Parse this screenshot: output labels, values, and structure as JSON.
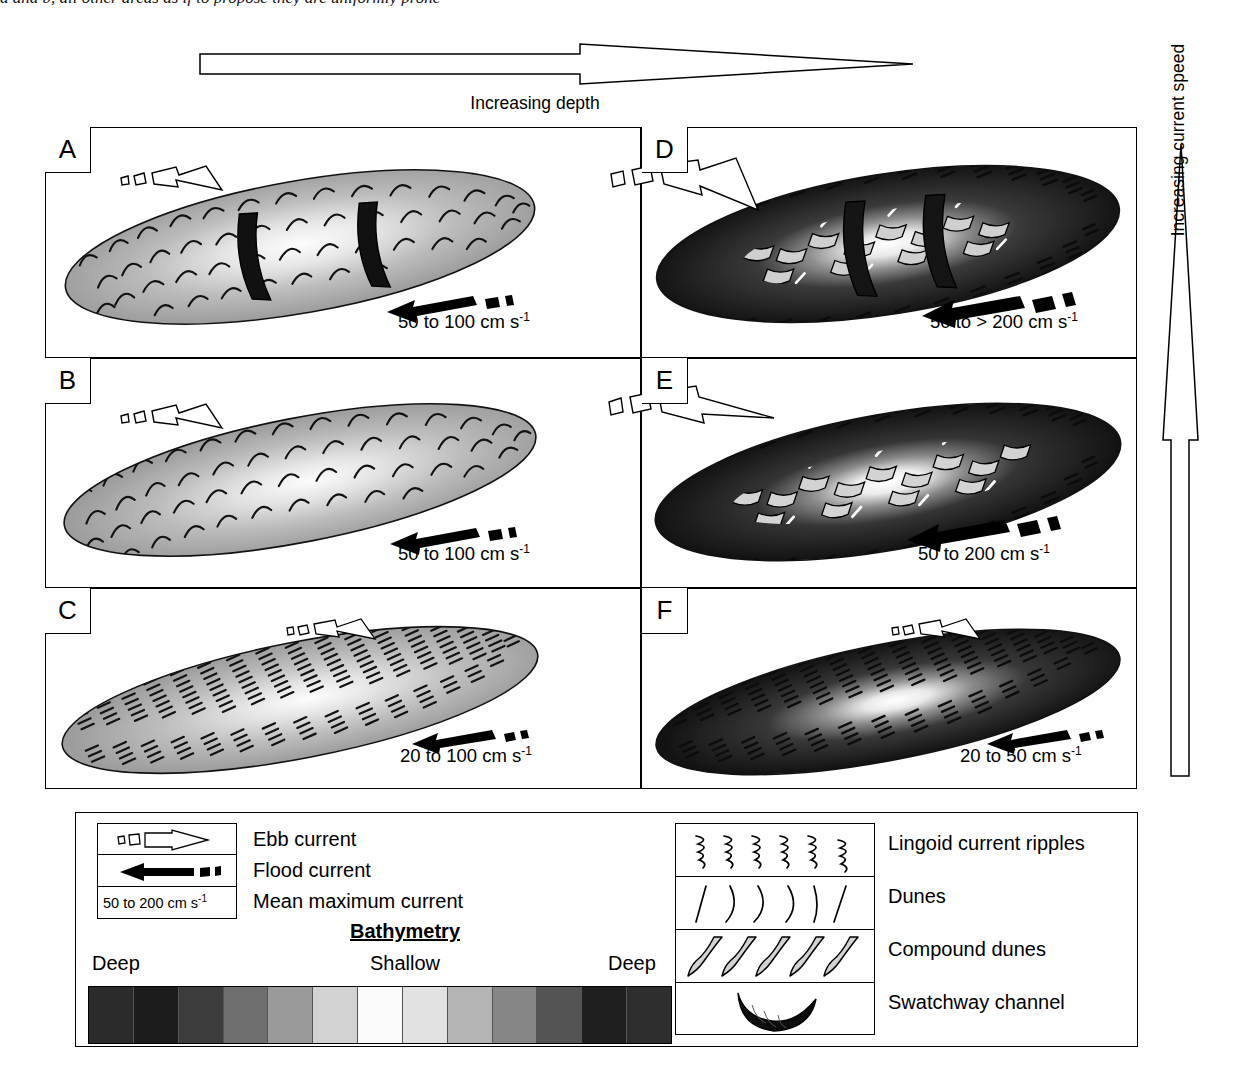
{
  "caption_sliver": "a and b, all other areas as if to propose they are uniformly prone",
  "axes": {
    "depth_arrow_label": "Increasing depth",
    "speed_arrow_label": "Increasing current speed"
  },
  "panels": [
    {
      "id": "A",
      "label": "A",
      "speed": "50 to 100 cm s",
      "exp": "-1",
      "tone": "light",
      "bedform": "dunes",
      "swatchways": 2,
      "ebb_arrow": "ebb-current-arrow",
      "flood_arrow": "flood-current-arrow"
    },
    {
      "id": "D",
      "label": "D",
      "speed": "50 to > 200 cm s",
      "exp": "-1",
      "tone": "dark",
      "bedform": "compound-dunes",
      "swatchways": 2,
      "ebb_arrow": "ebb-current-arrow",
      "flood_arrow": "flood-current-arrow"
    },
    {
      "id": "B",
      "label": "B",
      "speed": "50 to 100 cm s",
      "exp": "-1",
      "tone": "light",
      "bedform": "dunes",
      "swatchways": 0,
      "ebb_arrow": "ebb-current-arrow",
      "flood_arrow": "flood-current-arrow"
    },
    {
      "id": "E",
      "label": "E",
      "speed": "50 to 200 cm s",
      "exp": "-1",
      "tone": "dark",
      "bedform": "compound-dunes",
      "swatchways": 0,
      "ebb_arrow": "ebb-current-arrow",
      "flood_arrow": "flood-current-arrow"
    },
    {
      "id": "C",
      "label": "C",
      "speed": "20 to 100 cm s",
      "exp": "-1",
      "tone": "light",
      "bedform": "ripples",
      "swatchways": 0,
      "ebb_arrow": "ebb-current-arrow",
      "flood_arrow": "flood-current-arrow"
    },
    {
      "id": "F",
      "label": "F",
      "speed": "20 to 50 cm s",
      "exp": "-1",
      "tone": "dark",
      "bedform": "ripples",
      "swatchways": 0,
      "ebb_arrow": "ebb-current-arrow",
      "flood_arrow": "flood-current-arrow"
    }
  ],
  "legend": {
    "current_keys": [
      {
        "symbol": "ebb-current-arrow",
        "label": "Ebb current"
      },
      {
        "symbol": "flood-current-arrow",
        "label": "Flood current"
      },
      {
        "symbol": "speed-scale-box",
        "label": "Mean maximum current",
        "box_text": "50 to 200 cm s",
        "box_exp": "-1"
      }
    ],
    "bathymetry": {
      "title": "Bathymetry",
      "left_label": "Deep",
      "center_label": "Shallow",
      "right_label": "Deep",
      "swatches": [
        "#2b2b2b",
        "#1c1c1c",
        "#3c3c3c",
        "#6e6e6e",
        "#9a9a9a",
        "#d2d2d2",
        "#fafafa",
        "#e2e2e2",
        "#b4b4b4",
        "#868686",
        "#545454",
        "#1f1f1f",
        "#2e2e2e"
      ]
    },
    "bedforms": [
      {
        "symbol": "lingoid-ripples-icon",
        "label": "Lingoid current ripples"
      },
      {
        "symbol": "dunes-icon",
        "label": "Dunes"
      },
      {
        "symbol": "compound-dunes-icon",
        "label": "Compound dunes"
      },
      {
        "symbol": "swatchway-channel-icon",
        "label": "Swatchway channel"
      }
    ]
  },
  "chart_data": {
    "type": "diagram",
    "x_axis": {
      "label": "Increasing depth",
      "direction": "left-to-right",
      "categories": [
        "shallow (left column)",
        "deep (right column)"
      ]
    },
    "y_axis": {
      "label": "Increasing current speed",
      "direction": "bottom-to-top",
      "categories": [
        "low (row C/F)",
        "medium (row B/E)",
        "high (row A/D)"
      ]
    },
    "cells": [
      {
        "panel": "A",
        "depth": "shallow",
        "current_speed_rank": 3,
        "speed_range_cm_s": [
          50,
          100
        ],
        "bedforms": [
          "dunes"
        ],
        "swatchway_channels": 2
      },
      {
        "panel": "D",
        "depth": "deep",
        "current_speed_rank": 3,
        "speed_range_cm_s": [
          50,
          200
        ],
        "speed_open_ended": true,
        "bedforms": [
          "compound dunes",
          "dunes"
        ],
        "swatchway_channels": 2
      },
      {
        "panel": "B",
        "depth": "shallow",
        "current_speed_rank": 2,
        "speed_range_cm_s": [
          50,
          100
        ],
        "bedforms": [
          "dunes"
        ],
        "swatchway_channels": 0
      },
      {
        "panel": "E",
        "depth": "deep",
        "current_speed_rank": 2,
        "speed_range_cm_s": [
          50,
          200
        ],
        "bedforms": [
          "compound dunes",
          "dunes"
        ],
        "swatchway_channels": 0
      },
      {
        "panel": "C",
        "depth": "shallow",
        "current_speed_rank": 1,
        "speed_range_cm_s": [
          20,
          100
        ],
        "bedforms": [
          "lingoid current ripples"
        ],
        "swatchway_channels": 0
      },
      {
        "panel": "F",
        "depth": "deep",
        "current_speed_rank": 1,
        "speed_range_cm_s": [
          20,
          50
        ],
        "bedforms": [
          "lingoid current ripples"
        ],
        "swatchway_channels": 0
      }
    ]
  }
}
